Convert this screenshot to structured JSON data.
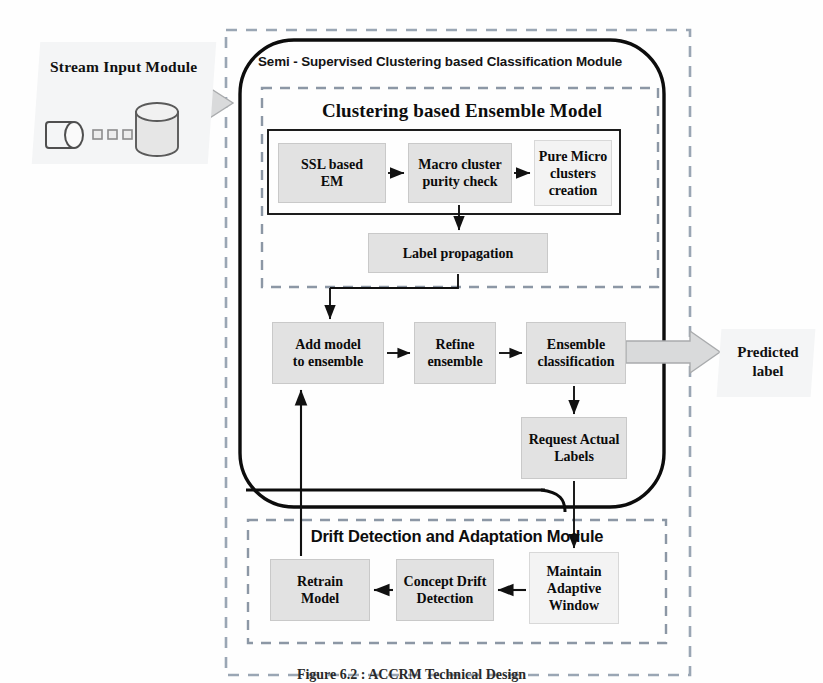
{
  "diagram": {
    "caption": "Figure 6.2 : ACCRM Technical Design"
  },
  "stream_module": {
    "title": "Stream Input  Module",
    "icons": {
      "pipe": "data-pipe-icon",
      "packets": "data-packet-icon",
      "database": "database-cylinder-icon"
    }
  },
  "main_module": {
    "title": "Semi - Supervised Clustering based Classification Module",
    "ensemble_section": {
      "title": "Clustering based Ensemble Model",
      "pipeline": [
        {
          "id": "ssl-based-em",
          "label": "SSL based\nEM"
        },
        {
          "id": "macro-cluster-purity-check",
          "label": "Macro cluster\npurity  check"
        },
        {
          "id": "pure-micro-clusters-creation",
          "label": "Pure Micro\nclusters\ncreation"
        }
      ],
      "label_propagation": {
        "id": "label-propagation",
        "label": "Label propagation"
      }
    },
    "ensemble_flow": [
      {
        "id": "add-model-to-ensemble",
        "label": "Add model\nto ensemble"
      },
      {
        "id": "refine-ensemble",
        "label": "Refine\nensemble"
      },
      {
        "id": "ensemble-classification",
        "label": "Ensemble\nclassification"
      }
    ],
    "request_labels": {
      "id": "request-actual-labels",
      "label": "Request Actual\nLabels"
    }
  },
  "drift_module": {
    "title": "Drift Detection and Adaptation Module",
    "flow": [
      {
        "id": "maintain-adaptive-window",
        "label": "Maintain\nAdaptive\nWindow"
      },
      {
        "id": "concept-drift-detection",
        "label": "Concept Drift\nDetection"
      },
      {
        "id": "retrain-model",
        "label": "Retrain\nModel"
      }
    ]
  },
  "output": {
    "predicted_label": "Predicted\nlabel"
  },
  "colors": {
    "box_fill": "#e2e2e2",
    "panel_fill": "#f4f5f6",
    "outer_dash": "#9aa6b4",
    "inner_dash": "#8c97a5",
    "stroke": "#111111",
    "arrow_fill": "#d9dadb"
  }
}
